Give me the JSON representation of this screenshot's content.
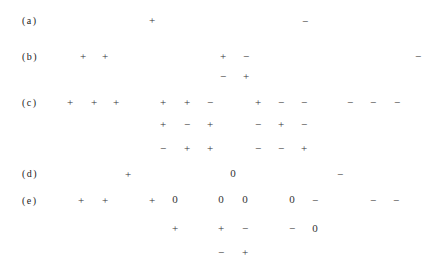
{
  "rows": [
    {
      "label": "(a)",
      "y": 20,
      "symbols": [
        {
          "x": 152,
          "y": 20,
          "s": "+"
        },
        {
          "x": 305,
          "y": 21,
          "s": "−"
        }
      ]
    },
    {
      "label": "(b)",
      "y": 56,
      "symbols": [
        {
          "x": 83,
          "y": 56,
          "s": "+"
        },
        {
          "x": 105,
          "y": 56,
          "s": "+"
        },
        {
          "x": 223,
          "y": 56,
          "s": "+"
        },
        {
          "x": 246,
          "y": 56,
          "s": "−"
        },
        {
          "x": 418,
          "y": 56,
          "s": "−"
        },
        {
          "x": 440,
          "y": 56,
          "s": "−"
        },
        {
          "x": 223,
          "y": 76,
          "s": "−"
        },
        {
          "x": 246,
          "y": 76,
          "s": "+"
        }
      ]
    },
    {
      "label": "(c)",
      "y": 102,
      "symbols": [
        {
          "x": 70,
          "y": 102,
          "s": "+"
        },
        {
          "x": 94,
          "y": 102,
          "s": "+"
        },
        {
          "x": 116,
          "y": 102,
          "s": "+"
        },
        {
          "x": 163,
          "y": 102,
          "s": "+"
        },
        {
          "x": 187,
          "y": 102,
          "s": "+"
        },
        {
          "x": 210,
          "y": 102,
          "s": "−"
        },
        {
          "x": 258,
          "y": 102,
          "s": "+"
        },
        {
          "x": 281,
          "y": 102,
          "s": "−"
        },
        {
          "x": 304,
          "y": 102,
          "s": "−"
        },
        {
          "x": 350,
          "y": 102,
          "s": "−"
        },
        {
          "x": 373,
          "y": 102,
          "s": "−"
        },
        {
          "x": 397,
          "y": 102,
          "s": "−"
        },
        {
          "x": 163,
          "y": 124,
          "s": "+"
        },
        {
          "x": 187,
          "y": 124,
          "s": "−"
        },
        {
          "x": 210,
          "y": 124,
          "s": "+"
        },
        {
          "x": 258,
          "y": 124,
          "s": "−"
        },
        {
          "x": 281,
          "y": 124,
          "s": "+"
        },
        {
          "x": 304,
          "y": 124,
          "s": "−"
        },
        {
          "x": 163,
          "y": 148,
          "s": "−"
        },
        {
          "x": 187,
          "y": 148,
          "s": "+"
        },
        {
          "x": 210,
          "y": 148,
          "s": "+"
        },
        {
          "x": 258,
          "y": 148,
          "s": "−"
        },
        {
          "x": 281,
          "y": 148,
          "s": "−"
        },
        {
          "x": 304,
          "y": 148,
          "s": "+"
        }
      ]
    },
    {
      "label": "(d)",
      "y": 173,
      "symbols": [
        {
          "x": 128,
          "y": 174,
          "s": "+"
        },
        {
          "x": 233,
          "y": 173,
          "s": "0"
        },
        {
          "x": 340,
          "y": 174,
          "s": "−"
        }
      ]
    },
    {
      "label": "(e)",
      "y": 200,
      "symbols": [
        {
          "x": 81,
          "y": 200,
          "s": "+"
        },
        {
          "x": 105,
          "y": 200,
          "s": "+"
        },
        {
          "x": 152,
          "y": 200,
          "s": "+"
        },
        {
          "x": 175,
          "y": 199,
          "s": "0"
        },
        {
          "x": 221,
          "y": 199,
          "s": "0"
        },
        {
          "x": 245,
          "y": 199,
          "s": "0"
        },
        {
          "x": 292,
          "y": 199,
          "s": "0"
        },
        {
          "x": 315,
          "y": 200,
          "s": "−"
        },
        {
          "x": 373,
          "y": 200,
          "s": "−"
        },
        {
          "x": 396,
          "y": 200,
          "s": "−"
        },
        {
          "x": 175,
          "y": 228,
          "s": "+"
        },
        {
          "x": 221,
          "y": 228,
          "s": "+"
        },
        {
          "x": 245,
          "y": 228,
          "s": "−"
        },
        {
          "x": 292,
          "y": 228,
          "s": "−"
        },
        {
          "x": 315,
          "y": 228,
          "s": "0"
        },
        {
          "x": 221,
          "y": 252,
          "s": "−"
        },
        {
          "x": 245,
          "y": 252,
          "s": "+"
        }
      ]
    }
  ]
}
